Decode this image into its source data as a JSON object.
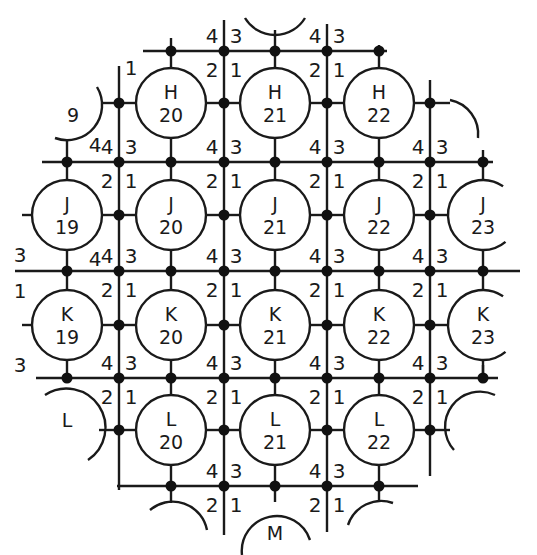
{
  "diagram": {
    "type": "wafer-die-grid",
    "colors": {
      "stroke": "#1a1a1a",
      "background": "#ffffff"
    },
    "columns": {
      "19": 67,
      "20": 171,
      "21": 275,
      "22": 379,
      "23": 483
    },
    "rows": {
      "H": 103,
      "J": 215,
      "K": 325,
      "L": 430,
      "M": 535
    },
    "vertical_lines_x": [
      119,
      224,
      327,
      430
    ],
    "horizontal_lines_y": [
      51,
      162,
      271,
      378,
      486
    ],
    "radius": 35,
    "cells": [
      {
        "row": "H",
        "col": "20",
        "label_row": "H",
        "label_col": "20",
        "full": true
      },
      {
        "row": "H",
        "col": "21",
        "label_row": "H",
        "label_col": "21",
        "full": true
      },
      {
        "row": "H",
        "col": "22",
        "label_row": "H",
        "label_col": "22",
        "full": true
      },
      {
        "row": "J",
        "col": "19",
        "label_row": "J",
        "label_col": "19",
        "full": true
      },
      {
        "row": "J",
        "col": "20",
        "label_row": "J",
        "label_col": "20",
        "full": true
      },
      {
        "row": "J",
        "col": "21",
        "label_row": "J",
        "label_col": "21",
        "full": true
      },
      {
        "row": "J",
        "col": "22",
        "label_row": "J",
        "label_col": "22",
        "full": true
      },
      {
        "row": "J",
        "col": "23",
        "label_row": "J",
        "label_col": "23",
        "full": false
      },
      {
        "row": "K",
        "col": "19",
        "label_row": "K",
        "label_col": "19",
        "full": true
      },
      {
        "row": "K",
        "col": "20",
        "label_row": "K",
        "label_col": "20",
        "full": true
      },
      {
        "row": "K",
        "col": "21",
        "label_row": "K",
        "label_col": "21",
        "full": true
      },
      {
        "row": "K",
        "col": "22",
        "label_row": "K",
        "label_col": "22",
        "full": true
      },
      {
        "row": "K",
        "col": "23",
        "label_row": "K",
        "label_col": "23",
        "full": false
      },
      {
        "row": "L",
        "col": "20",
        "label_row": "L",
        "label_col": "20",
        "full": true
      },
      {
        "row": "L",
        "col": "21",
        "label_row": "L",
        "label_col": "21",
        "full": true
      },
      {
        "row": "L",
        "col": "22",
        "label_row": "L",
        "label_col": "22",
        "full": true
      }
    ],
    "partial_labels": [
      {
        "text": "9",
        "x": 73,
        "y": 122,
        "note": "partial H19 cut by wafer edge"
      },
      {
        "text": "L",
        "x": 67,
        "y": 427,
        "note": "partial L19"
      },
      {
        "text": "M",
        "x": 275,
        "y": 540,
        "note": "partial M21"
      }
    ],
    "quadrant_labels": [
      "1",
      "2",
      "3",
      "4"
    ]
  }
}
